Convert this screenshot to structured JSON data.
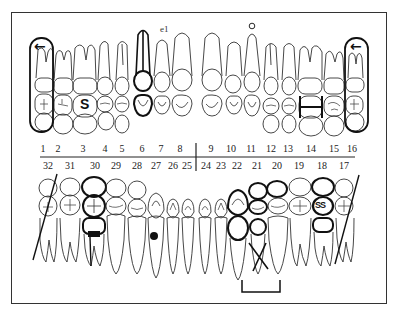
{
  "chart": {
    "colors": {
      "line": "#333333",
      "ink": "#111111",
      "background": "#ffffff"
    },
    "upper_numbers": [
      {
        "n": "1",
        "x": 43
      },
      {
        "n": "2",
        "x": 58
      },
      {
        "n": "3",
        "x": 83
      },
      {
        "n": "4",
        "x": 105
      },
      {
        "n": "5",
        "x": 122
      },
      {
        "n": "6",
        "x": 142
      },
      {
        "n": "7",
        "x": 161
      },
      {
        "n": "8",
        "x": 180
      },
      {
        "n": "9",
        "x": 211
      },
      {
        "n": "10",
        "x": 231
      },
      {
        "n": "11",
        "x": 251
      },
      {
        "n": "12",
        "x": 271
      },
      {
        "n": "13",
        "x": 288
      },
      {
        "n": "14",
        "x": 311
      },
      {
        "n": "15",
        "x": 334
      },
      {
        "n": "16",
        "x": 352
      }
    ],
    "lower_numbers": [
      {
        "n": "32",
        "x": 48
      },
      {
        "n": "31",
        "x": 70
      },
      {
        "n": "30",
        "x": 95
      },
      {
        "n": "29",
        "x": 116
      },
      {
        "n": "28",
        "x": 137
      },
      {
        "n": "27",
        "x": 156
      },
      {
        "n": "26",
        "x": 173
      },
      {
        "n": "25",
        "x": 187
      },
      {
        "n": "24",
        "x": 206
      },
      {
        "n": "23",
        "x": 221
      },
      {
        "n": "22",
        "x": 237
      },
      {
        "n": "21",
        "x": 257
      },
      {
        "n": "20",
        "x": 277
      },
      {
        "n": "19",
        "x": 299
      },
      {
        "n": "18",
        "x": 322
      },
      {
        "n": "17",
        "x": 344
      }
    ],
    "annotations": {
      "tooth3_symbol": "S",
      "tooth7_label": "e1",
      "tooth11_mark": "o",
      "tooth18_symbol": "SS",
      "arrow_glyph": "←"
    },
    "markings": [
      {
        "tooth": "1",
        "type": "encircled-missing-arrow"
      },
      {
        "tooth": "3",
        "type": "symbol-S"
      },
      {
        "tooth": "6",
        "type": "root-canal-crown"
      },
      {
        "tooth": "7",
        "type": "label-e1"
      },
      {
        "tooth": "11",
        "type": "circle-above"
      },
      {
        "tooth": "14",
        "type": "bracket-H"
      },
      {
        "tooth": "16",
        "type": "encircled-missing-arrow"
      },
      {
        "tooth": "17",
        "type": "slash-extraction"
      },
      {
        "tooth": "18",
        "type": "crown-SS"
      },
      {
        "tooth": "20",
        "type": "bridge-pontic"
      },
      {
        "tooth": "21",
        "type": "X-missing-bridge"
      },
      {
        "tooth": "22",
        "type": "bridge-abutment"
      },
      {
        "tooth": "27",
        "type": "filled-dot"
      },
      {
        "tooth": "30",
        "type": "crown-with-post"
      },
      {
        "tooth": "32",
        "type": "slash-extraction"
      }
    ]
  }
}
